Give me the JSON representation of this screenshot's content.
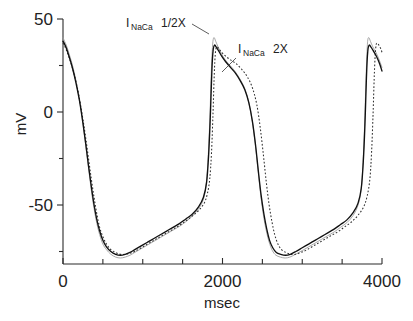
{
  "chart_data": {
    "type": "line",
    "title": "",
    "xlabel": "msec",
    "ylabel": "mV",
    "xlim": [
      0,
      4000
    ],
    "ylim": [
      -85,
      55
    ],
    "grid": false,
    "legend_position": "inline-annotations",
    "x_ticks_major": [
      0,
      2000,
      4000
    ],
    "x_tick_labels": [
      "0",
      "2000",
      "4000"
    ],
    "x_ticks_minor": [
      500,
      1000,
      1500,
      2500,
      3000,
      3500
    ],
    "y_ticks_major": [
      50,
      0,
      -50
    ],
    "y_tick_labels": [
      "50",
      "0",
      "-50"
    ],
    "y_ticks_minor": [
      25,
      -25,
      -75
    ],
    "annotations": [
      {
        "name": "half-label",
        "prefix": "I",
        "sub": "NaCa",
        "suffix": "1/2X",
        "x_msec": 790,
        "y_mv": 52
      },
      {
        "name": "two-label",
        "prefix": "I",
        "sub": "NaCa",
        "suffix": "2X",
        "x_msec": 2180,
        "y_mv": 41
      }
    ],
    "series": [
      {
        "name": "control",
        "style": "solid",
        "color": "#111111",
        "points": [
          [
            0,
            38
          ],
          [
            20,
            36.5
          ],
          [
            45,
            34
          ],
          [
            75,
            30
          ],
          [
            110,
            25
          ],
          [
            145,
            19
          ],
          [
            180,
            12
          ],
          [
            215,
            4
          ],
          [
            250,
            -6
          ],
          [
            285,
            -17
          ],
          [
            320,
            -29
          ],
          [
            355,
            -40
          ],
          [
            390,
            -50
          ],
          [
            425,
            -58
          ],
          [
            460,
            -64
          ],
          [
            500,
            -69
          ],
          [
            545,
            -72.5
          ],
          [
            600,
            -75
          ],
          [
            660,
            -76.5
          ],
          [
            720,
            -77
          ],
          [
            780,
            -76.5
          ],
          [
            840,
            -75.5
          ],
          [
            900,
            -74
          ],
          [
            980,
            -72
          ],
          [
            1060,
            -70
          ],
          [
            1140,
            -68
          ],
          [
            1220,
            -66
          ],
          [
            1300,
            -64
          ],
          [
            1380,
            -62
          ],
          [
            1460,
            -60
          ],
          [
            1540,
            -57.5
          ],
          [
            1620,
            -55
          ],
          [
            1700,
            -51
          ],
          [
            1760,
            -46
          ],
          [
            1800,
            -38
          ],
          [
            1825,
            -24
          ],
          [
            1845,
            -5
          ],
          [
            1860,
            14
          ],
          [
            1872,
            27
          ],
          [
            1885,
            34
          ],
          [
            1900,
            36
          ],
          [
            1920,
            35
          ],
          [
            1950,
            33
          ],
          [
            1990,
            30
          ],
          [
            2040,
            27
          ],
          [
            2100,
            24
          ],
          [
            2160,
            21
          ],
          [
            2220,
            17
          ],
          [
            2280,
            12
          ],
          [
            2330,
            5
          ],
          [
            2375,
            -5
          ],
          [
            2415,
            -18
          ],
          [
            2450,
            -32
          ],
          [
            2485,
            -45
          ],
          [
            2520,
            -55
          ],
          [
            2555,
            -63
          ],
          [
            2590,
            -69
          ],
          [
            2630,
            -73
          ],
          [
            2675,
            -75.5
          ],
          [
            2730,
            -76.5
          ],
          [
            2790,
            -77
          ],
          [
            2850,
            -76.5
          ],
          [
            2920,
            -75
          ],
          [
            3000,
            -73
          ],
          [
            3080,
            -71
          ],
          [
            3160,
            -69
          ],
          [
            3240,
            -67
          ],
          [
            3320,
            -65
          ],
          [
            3400,
            -63
          ],
          [
            3480,
            -60.5
          ],
          [
            3560,
            -58
          ],
          [
            3640,
            -54
          ],
          [
            3700,
            -49
          ],
          [
            3740,
            -41
          ],
          [
            3765,
            -27
          ],
          [
            3785,
            -8
          ],
          [
            3800,
            12
          ],
          [
            3812,
            26
          ],
          [
            3825,
            34
          ],
          [
            3840,
            36
          ],
          [
            3860,
            35
          ],
          [
            3890,
            33
          ],
          [
            3930,
            30
          ],
          [
            3970,
            26
          ],
          [
            4000,
            22
          ]
        ]
      },
      {
        "name": "I_NaCa 1/2X",
        "style": "thin-solid",
        "color": "#9a9a9a",
        "points": [
          [
            0,
            40
          ],
          [
            20,
            38
          ],
          [
            45,
            35.5
          ],
          [
            75,
            31.5
          ],
          [
            110,
            26.5
          ],
          [
            145,
            20.5
          ],
          [
            180,
            13
          ],
          [
            215,
            4.5
          ],
          [
            250,
            -6
          ],
          [
            285,
            -18
          ],
          [
            320,
            -30
          ],
          [
            355,
            -42
          ],
          [
            390,
            -52
          ],
          [
            425,
            -60
          ],
          [
            460,
            -66
          ],
          [
            500,
            -71
          ],
          [
            545,
            -74
          ],
          [
            600,
            -76.5
          ],
          [
            660,
            -78
          ],
          [
            720,
            -78.5
          ],
          [
            780,
            -78
          ],
          [
            840,
            -77
          ],
          [
            900,
            -75.5
          ],
          [
            980,
            -73.5
          ],
          [
            1060,
            -71.5
          ],
          [
            1140,
            -69.5
          ],
          [
            1220,
            -67.5
          ],
          [
            1300,
            -65.5
          ],
          [
            1380,
            -63.5
          ],
          [
            1460,
            -61.5
          ],
          [
            1540,
            -59
          ],
          [
            1620,
            -56
          ],
          [
            1700,
            -52
          ],
          [
            1760,
            -47
          ],
          [
            1798,
            -38
          ],
          [
            1822,
            -23
          ],
          [
            1842,
            -3
          ],
          [
            1856,
            17
          ],
          [
            1868,
            30
          ],
          [
            1880,
            38
          ],
          [
            1895,
            40
          ],
          [
            1915,
            38
          ],
          [
            1945,
            35
          ],
          [
            1985,
            31.5
          ],
          [
            2035,
            28
          ],
          [
            2095,
            25
          ],
          [
            2155,
            22
          ],
          [
            2215,
            18
          ],
          [
            2275,
            13
          ],
          [
            2325,
            6
          ],
          [
            2370,
            -4
          ],
          [
            2410,
            -17
          ],
          [
            2445,
            -31
          ],
          [
            2480,
            -45
          ],
          [
            2515,
            -56
          ],
          [
            2550,
            -64
          ],
          [
            2585,
            -70
          ],
          [
            2625,
            -74.5
          ],
          [
            2670,
            -77
          ],
          [
            2725,
            -78
          ],
          [
            2785,
            -78.5
          ],
          [
            2845,
            -78
          ],
          [
            2915,
            -76.5
          ],
          [
            3000,
            -74.5
          ],
          [
            3080,
            -72.5
          ],
          [
            3160,
            -70.5
          ],
          [
            3240,
            -68.5
          ],
          [
            3320,
            -66.5
          ],
          [
            3400,
            -64.5
          ],
          [
            3480,
            -62
          ],
          [
            3560,
            -59.5
          ],
          [
            3640,
            -55.5
          ],
          [
            3700,
            -50
          ],
          [
            3738,
            -42
          ],
          [
            3762,
            -27
          ],
          [
            3782,
            -7
          ],
          [
            3796,
            13
          ],
          [
            3808,
            28
          ],
          [
            3820,
            38
          ],
          [
            3835,
            40
          ],
          [
            3855,
            38
          ],
          [
            3885,
            35
          ],
          [
            3925,
            32
          ],
          [
            3965,
            28
          ],
          [
            4000,
            24
          ]
        ]
      },
      {
        "name": "I_NaCa 2X",
        "style": "dotted",
        "color": "#2f2f2f",
        "points": [
          [
            0,
            37
          ],
          [
            20,
            35.5
          ],
          [
            45,
            33
          ],
          [
            75,
            29.5
          ],
          [
            110,
            25
          ],
          [
            145,
            19.5
          ],
          [
            180,
            13
          ],
          [
            215,
            5
          ],
          [
            250,
            -4
          ],
          [
            285,
            -14
          ],
          [
            320,
            -25
          ],
          [
            355,
            -36
          ],
          [
            390,
            -46
          ],
          [
            425,
            -55
          ],
          [
            460,
            -62
          ],
          [
            500,
            -67
          ],
          [
            545,
            -71
          ],
          [
            600,
            -74
          ],
          [
            660,
            -75.5
          ],
          [
            720,
            -76.5
          ],
          [
            780,
            -76.5
          ],
          [
            840,
            -76
          ],
          [
            900,
            -75
          ],
          [
            980,
            -73
          ],
          [
            1060,
            -71
          ],
          [
            1140,
            -69
          ],
          [
            1220,
            -67
          ],
          [
            1300,
            -65
          ],
          [
            1380,
            -63
          ],
          [
            1460,
            -61
          ],
          [
            1540,
            -58.5
          ],
          [
            1620,
            -56
          ],
          [
            1700,
            -53
          ],
          [
            1770,
            -49
          ],
          [
            1810,
            -44
          ],
          [
            1840,
            -36
          ],
          [
            1862,
            -22
          ],
          [
            1880,
            -2
          ],
          [
            1894,
            17
          ],
          [
            1906,
            29
          ],
          [
            1918,
            34
          ],
          [
            1932,
            35
          ],
          [
            1955,
            34
          ],
          [
            1990,
            32
          ],
          [
            2040,
            30
          ],
          [
            2100,
            28
          ],
          [
            2170,
            26
          ],
          [
            2240,
            23
          ],
          [
            2310,
            19
          ],
          [
            2375,
            13
          ],
          [
            2430,
            4
          ],
          [
            2475,
            -9
          ],
          [
            2515,
            -24
          ],
          [
            2550,
            -38
          ],
          [
            2585,
            -50
          ],
          [
            2620,
            -59
          ],
          [
            2655,
            -66
          ],
          [
            2695,
            -71
          ],
          [
            2740,
            -74
          ],
          [
            2795,
            -75.5
          ],
          [
            2855,
            -76.5
          ],
          [
            2915,
            -76.5
          ],
          [
            2985,
            -75.5
          ],
          [
            3060,
            -74
          ],
          [
            3140,
            -72
          ],
          [
            3220,
            -70
          ],
          [
            3300,
            -68
          ],
          [
            3380,
            -66
          ],
          [
            3460,
            -64
          ],
          [
            3540,
            -61.5
          ],
          [
            3620,
            -59
          ],
          [
            3700,
            -55.5
          ],
          [
            3770,
            -51
          ],
          [
            3815,
            -45
          ],
          [
            3848,
            -36
          ],
          [
            3870,
            -21
          ],
          [
            3888,
            -1
          ],
          [
            3902,
            18
          ],
          [
            3914,
            30
          ],
          [
            3926,
            36
          ],
          [
            3940,
            37
          ],
          [
            3960,
            36
          ],
          [
            3985,
            34
          ],
          [
            4000,
            32
          ]
        ]
      }
    ]
  }
}
